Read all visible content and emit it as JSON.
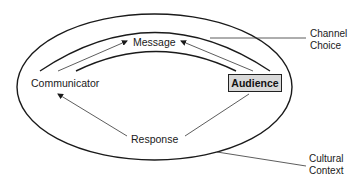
{
  "diagram": {
    "nodes": {
      "message": "Message",
      "communicator": "Communicator",
      "audience": "Audience",
      "response": "Response"
    },
    "callouts": {
      "channel": [
        "Channel",
        "Choice"
      ],
      "culture": [
        "Cultural",
        "Context"
      ]
    },
    "colors": {
      "line": "#1a1a1a",
      "audience_box_fill": "#d9d9d9",
      "background": "#ffffff"
    }
  }
}
